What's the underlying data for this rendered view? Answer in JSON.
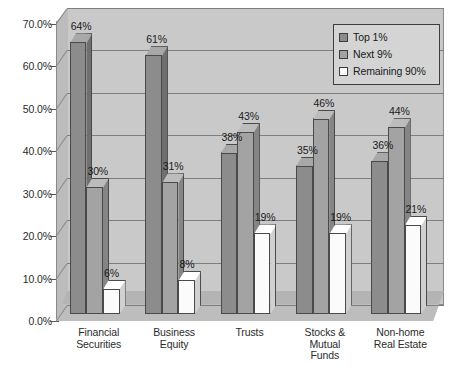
{
  "chart_data": {
    "type": "bar",
    "title": "",
    "subtitle": "",
    "xlabel": "",
    "ylabel": "",
    "ylim": [
      0,
      70
    ],
    "y_tick_step": 10,
    "grid": true,
    "legend_position": "top-right",
    "orientation": "vertical",
    "grouping": "grouped",
    "style": "3d-perspective",
    "categories": [
      "Financial Securities",
      "Business Equity",
      "Trusts",
      "Stocks & Mutual Funds",
      "Non-home Real Estate"
    ],
    "category_lines": [
      [
        "Financial",
        "Securities"
      ],
      [
        "Business",
        "Equity"
      ],
      [
        "Trusts"
      ],
      [
        "Stocks &",
        "Mutual",
        "Funds"
      ],
      [
        "Non-home",
        "Real Estate"
      ]
    ],
    "y_tick_labels": [
      "70.0%",
      "60.0%",
      "50.0%",
      "40.0%",
      "30.0%",
      "20.0%",
      "10.0%",
      "0.0%"
    ],
    "y_tick_values": [
      70,
      60,
      50,
      40,
      30,
      20,
      10,
      0
    ],
    "series": [
      {
        "name": "Top 1%",
        "color": "#8c8c8c",
        "top_color": "#a8a8a8",
        "side_color": "#6f6f6f",
        "values": [
          64,
          61,
          38,
          35,
          36
        ],
        "labels": [
          "64%",
          "61%",
          "38%",
          "35%",
          "36%"
        ]
      },
      {
        "name": "Next 9%",
        "color": "#a3a3a3",
        "top_color": "#bcbcbc",
        "side_color": "#858585",
        "values": [
          30,
          31,
          43,
          46,
          44
        ],
        "labels": [
          "30%",
          "31%",
          "43%",
          "46%",
          "44%"
        ]
      },
      {
        "name": "Remaining 90%",
        "color": "#fbfbfb",
        "top_color": "#ffffff",
        "side_color": "#d0d0d0",
        "values": [
          6,
          8,
          19,
          19,
          21
        ],
        "labels": [
          "6%",
          "8%",
          "19%",
          "19%",
          "21%"
        ]
      }
    ]
  },
  "legend": {
    "items": [
      {
        "label": "Top 1%"
      },
      {
        "label": "Next 9%"
      },
      {
        "label": "Remaining 90%"
      }
    ]
  }
}
